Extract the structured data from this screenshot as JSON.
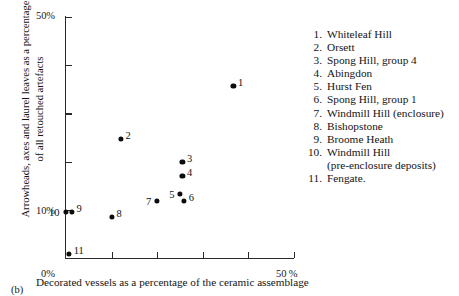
{
  "figure": {
    "panel_label": "(b)"
  },
  "axes": {
    "x_title": "Decorated vessels as a percentage of the  ceramic assemblage",
    "y_title": "Arrowheads, axes and laurel leaves as a percentage of all retouched artefacts",
    "x_tick_labels": [
      "0%",
      "50 %"
    ],
    "y_tick_labels": [
      "50%",
      "10%",
      "0%"
    ]
  },
  "legend": {
    "entries": [
      {
        "num": "1.",
        "label": "Whiteleaf Hill"
      },
      {
        "num": "2.",
        "label": "Orsett"
      },
      {
        "num": "3.",
        "label": "Spong Hill, group 4"
      },
      {
        "num": "4.",
        "label": "Abingdon"
      },
      {
        "num": "5.",
        "label": "Hurst Fen"
      },
      {
        "num": "6.",
        "label": "Spong Hill, group 1"
      },
      {
        "num": "7.",
        "label": "Windmill Hill (enclosure)"
      },
      {
        "num": "8.",
        "label": "Bishopstone"
      },
      {
        "num": "9.",
        "label": "Broome Heath"
      },
      {
        "num": "10.",
        "label": "Windmill Hill",
        "label2": "(pre-enclosure deposits)"
      },
      {
        "num": "11.",
        "label": "Fengate."
      }
    ]
  },
  "chart_data": {
    "type": "scatter",
    "title": "",
    "xlabel": "Decorated vessels as a percentage of the ceramic assemblage",
    "ylabel": "Arrowheads, axes and laurel leaves as a percentage of all retouched artefacts",
    "xlim": [
      0,
      50
    ],
    "ylim": [
      0,
      50
    ],
    "xtick_values": [
      0,
      10,
      20,
      30,
      40,
      50
    ],
    "ytick_values": [
      0,
      10,
      20,
      30,
      40,
      50
    ],
    "xtick_labeled": {
      "0": "0%",
      "50": "50 %"
    },
    "ytick_labeled": {
      "0": "0%",
      "10": "10%",
      "50": "50%"
    },
    "grid": false,
    "legend_position": "right",
    "marker": "filled-circle",
    "marker_color": "#0d0d0d",
    "points": [
      {
        "id": "1",
        "name": "Whiteleaf Hill",
        "x": 36.8,
        "y": 35.7,
        "label_side": "right"
      },
      {
        "id": "2",
        "name": "Orsett",
        "x": 12.1,
        "y": 24.7,
        "label_side": "right"
      },
      {
        "id": "3",
        "name": "Spong Hill, group 4",
        "x": 25.6,
        "y": 19.9,
        "label_side": "right"
      },
      {
        "id": "4",
        "name": "Abingdon",
        "x": 25.6,
        "y": 17.0,
        "label_side": "right"
      },
      {
        "id": "5",
        "name": "Hurst Fen",
        "x": 25.1,
        "y": 13.3,
        "label_side": "left"
      },
      {
        "id": "6",
        "name": "Spong Hill, group 1",
        "x": 26.0,
        "y": 11.8,
        "label_side": "right"
      },
      {
        "id": "7",
        "name": "Windmill Hill (enclosure)",
        "x": 20.0,
        "y": 11.8,
        "label_side": "left"
      },
      {
        "id": "8",
        "name": "Bishopstone",
        "x": 10.1,
        "y": 8.5,
        "label_side": "right"
      },
      {
        "id": "9",
        "name": "Broome Heath",
        "x": 1.3,
        "y": 9.5,
        "label_side": "right"
      },
      {
        "id": "10",
        "name": "Windmill Hill (pre-enclosure deposits)",
        "x": 0.0,
        "y": 9.5,
        "label_side": "left"
      },
      {
        "id": "11",
        "name": "Fengate",
        "x": 0.7,
        "y": 0.8,
        "label_side": "right"
      }
    ]
  }
}
